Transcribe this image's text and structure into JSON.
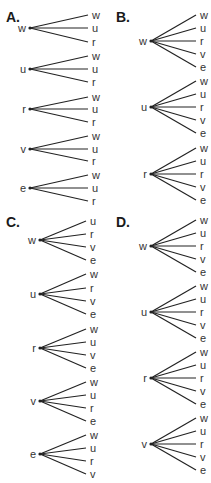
{
  "panels": [
    {
      "id": "A",
      "label": "A.",
      "label_pos": [
        6,
        22
      ],
      "root_x": 30,
      "leaf_x": 88,
      "leaf_label_x": 92,
      "trees": [
        {
          "root": "w",
          "y": 28,
          "leaves": [
            {
              "t": "w",
              "y": 15
            },
            {
              "t": "u",
              "y": 28
            },
            {
              "t": "r",
              "y": 42
            }
          ]
        },
        {
          "root": "u",
          "y": 69,
          "leaves": [
            {
              "t": "w",
              "y": 56
            },
            {
              "t": "u",
              "y": 69
            },
            {
              "t": "r",
              "y": 82
            }
          ]
        },
        {
          "root": "r",
          "y": 109,
          "leaves": [
            {
              "t": "w",
              "y": 97
            },
            {
              "t": "u",
              "y": 109
            },
            {
              "t": "r",
              "y": 122
            }
          ]
        },
        {
          "root": "v",
          "y": 149,
          "leaves": [
            {
              "t": "w",
              "y": 136
            },
            {
              "t": "u",
              "y": 149
            },
            {
              "t": "r",
              "y": 161
            }
          ]
        },
        {
          "root": "e",
          "y": 188,
          "leaves": [
            {
              "t": "w",
              "y": 175
            },
            {
              "t": "u",
              "y": 188
            },
            {
              "t": "r",
              "y": 201
            }
          ]
        }
      ]
    },
    {
      "id": "B",
      "label": "B.",
      "label_pos": [
        116,
        22
      ],
      "root_x": 151,
      "leaf_x": 196,
      "leaf_label_x": 200,
      "trees": [
        {
          "root": "w",
          "y": 41,
          "leaves": [
            {
              "t": "w",
              "y": 15
            },
            {
              "t": "u",
              "y": 28
            },
            {
              "t": "r",
              "y": 41
            },
            {
              "t": "v",
              "y": 54
            },
            {
              "t": "e",
              "y": 67
            }
          ]
        },
        {
          "root": "u",
          "y": 107,
          "leaves": [
            {
              "t": "w",
              "y": 81
            },
            {
              "t": "u",
              "y": 94
            },
            {
              "t": "r",
              "y": 107
            },
            {
              "t": "v",
              "y": 120
            },
            {
              "t": "e",
              "y": 133
            }
          ]
        },
        {
          "root": "r",
          "y": 174,
          "leaves": [
            {
              "t": "w",
              "y": 148
            },
            {
              "t": "u",
              "y": 161
            },
            {
              "t": "r",
              "y": 174
            },
            {
              "t": "v",
              "y": 187
            },
            {
              "t": "e",
              "y": 200
            }
          ]
        }
      ]
    },
    {
      "id": "C",
      "label": "C.",
      "label_pos": [
        6,
        227
      ],
      "root_x": 40,
      "leaf_x": 86,
      "leaf_label_x": 90,
      "trees": [
        {
          "root": "w",
          "y": 240,
          "leaves": [
            {
              "t": "u",
              "y": 221
            },
            {
              "t": "r",
              "y": 234
            },
            {
              "t": "v",
              "y": 247
            },
            {
              "t": "e",
              "y": 260
            }
          ]
        },
        {
          "root": "u",
          "y": 294,
          "leaves": [
            {
              "t": "w",
              "y": 274
            },
            {
              "t": "r",
              "y": 288
            },
            {
              "t": "v",
              "y": 301
            },
            {
              "t": "e",
              "y": 314
            }
          ]
        },
        {
          "root": "r",
          "y": 348,
          "leaves": [
            {
              "t": "w",
              "y": 329
            },
            {
              "t": "u",
              "y": 342
            },
            {
              "t": "v",
              "y": 355
            },
            {
              "t": "e",
              "y": 368
            }
          ]
        },
        {
          "root": "v",
          "y": 401,
          "leaves": [
            {
              "t": "w",
              "y": 382
            },
            {
              "t": "u",
              "y": 395
            },
            {
              "t": "r",
              "y": 408
            },
            {
              "t": "e",
              "y": 421
            }
          ]
        },
        {
          "root": "e",
          "y": 454,
          "leaves": [
            {
              "t": "w",
              "y": 435
            },
            {
              "t": "u",
              "y": 448
            },
            {
              "t": "r",
              "y": 461
            },
            {
              "t": "v",
              "y": 474
            }
          ]
        }
      ]
    },
    {
      "id": "D",
      "label": "D.",
      "label_pos": [
        116,
        227
      ],
      "root_x": 151,
      "leaf_x": 196,
      "leaf_label_x": 200,
      "trees": [
        {
          "root": "w",
          "y": 246,
          "leaves": [
            {
              "t": "w",
              "y": 220
            },
            {
              "t": "u",
              "y": 233
            },
            {
              "t": "r",
              "y": 246
            },
            {
              "t": "v",
              "y": 259
            },
            {
              "t": "e",
              "y": 272
            }
          ]
        },
        {
          "root": "u",
          "y": 312,
          "leaves": [
            {
              "t": "w",
              "y": 286
            },
            {
              "t": "u",
              "y": 299
            },
            {
              "t": "r",
              "y": 312
            },
            {
              "t": "v",
              "y": 325
            },
            {
              "t": "e",
              "y": 338
            }
          ]
        },
        {
          "root": "r",
          "y": 378,
          "leaves": [
            {
              "t": "w",
              "y": 352
            },
            {
              "t": "u",
              "y": 365
            },
            {
              "t": "r",
              "y": 378
            },
            {
              "t": "v",
              "y": 391
            },
            {
              "t": "e",
              "y": 404
            }
          ]
        },
        {
          "root": "v",
          "y": 444,
          "leaves": [
            {
              "t": "w",
              "y": 418
            },
            {
              "t": "u",
              "y": 431
            },
            {
              "t": "r",
              "y": 444
            },
            {
              "t": "v",
              "y": 457
            },
            {
              "t": "e",
              "y": 470
            }
          ]
        }
      ]
    }
  ]
}
